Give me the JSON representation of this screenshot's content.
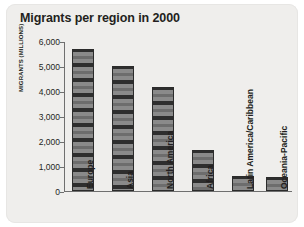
{
  "chart_data": {
    "type": "bar",
    "title": "Migrants per region in 2000",
    "xlabel": "",
    "ylabel": "MIGRANTS (MILLIONS)",
    "ylim": [
      0,
      6000
    ],
    "grid": false,
    "legend": "none",
    "categories": [
      "Europe",
      "Asia",
      "North America",
      "Africa",
      "Latin America/Caribbean",
      "Oceania-Pacific"
    ],
    "values": [
      5700,
      5000,
      4150,
      1650,
      600,
      580
    ],
    "y_ticks": [
      {
        "value": 6000,
        "label": "6,000"
      },
      {
        "value": 5000,
        "label": "5,000"
      },
      {
        "value": 4000,
        "label": "4,000"
      },
      {
        "value": 3000,
        "label": "3,000"
      },
      {
        "value": 2000,
        "label": "2,000"
      },
      {
        "value": 1000,
        "label": "1,000"
      },
      {
        "value": 0,
        "label": "0"
      }
    ],
    "colors": {
      "panel_background": "#efeeec",
      "bar_fill": "#8f8f8f",
      "bar_outline": "#2b2b2b",
      "axis": "#6f6f6f",
      "text": "#231f20"
    }
  }
}
